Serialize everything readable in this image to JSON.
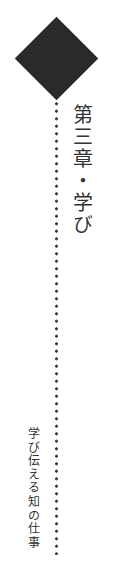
{
  "chapter": {
    "title": "第三章・学び",
    "subtitle": "学び伝える知の仕事"
  },
  "decoration": {
    "diamond_color": "#2a2a2a",
    "dot_color": "#333333"
  }
}
